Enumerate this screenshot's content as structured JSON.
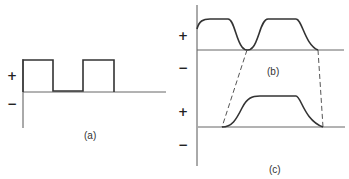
{
  "panels": {
    "a": {
      "label": "(a)",
      "plus": "+",
      "minus": "−",
      "waveform": "square"
    },
    "b": {
      "label": "(b)",
      "plus": "+",
      "minus": "−",
      "waveform": "smoothed pulses"
    },
    "c": {
      "label": "(c)",
      "plus": "+",
      "minus": "−",
      "waveform": "single smoothed pulse"
    }
  },
  "colors": {
    "line": "#333333",
    "dashed": "#555555",
    "background": "#ffffff"
  }
}
